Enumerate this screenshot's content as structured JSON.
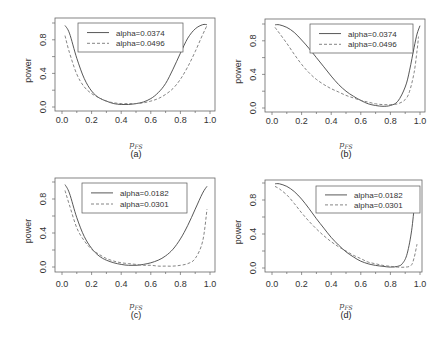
{
  "chart_data": [
    {
      "panel": "(a)",
      "type": "line",
      "xlabel": "p_FS",
      "ylabel": "power",
      "caption": "(a)",
      "xlim": [
        0,
        1
      ],
      "ylim": [
        0,
        1
      ],
      "xticks": [
        "0.0",
        "0.2",
        "0.4",
        "0.6",
        "0.8",
        "1.0"
      ],
      "yticks": [
        "0.0",
        "0.4",
        "0.8"
      ],
      "legend_position": "top-center",
      "series": [
        {
          "name": "alpha=0.0374",
          "style": "solid",
          "x": [
            0.02,
            0.05,
            0.1,
            0.15,
            0.2,
            0.25,
            0.3,
            0.35,
            0.4,
            0.45,
            0.5,
            0.55,
            0.6,
            0.65,
            0.7,
            0.75,
            0.8,
            0.85,
            0.9,
            0.95,
            0.98
          ],
          "y": [
            0.97,
            0.88,
            0.58,
            0.34,
            0.19,
            0.11,
            0.07,
            0.04,
            0.03,
            0.03,
            0.04,
            0.06,
            0.1,
            0.17,
            0.28,
            0.45,
            0.64,
            0.82,
            0.93,
            0.98,
            0.98
          ]
        },
        {
          "name": "alpha=0.0496",
          "style": "dashed",
          "x": [
            0.02,
            0.05,
            0.1,
            0.15,
            0.2,
            0.25,
            0.3,
            0.35,
            0.4,
            0.45,
            0.5,
            0.55,
            0.6,
            0.65,
            0.7,
            0.75,
            0.8,
            0.85,
            0.9,
            0.95,
            0.98
          ],
          "y": [
            0.85,
            0.65,
            0.39,
            0.24,
            0.16,
            0.11,
            0.07,
            0.05,
            0.04,
            0.04,
            0.04,
            0.05,
            0.07,
            0.1,
            0.15,
            0.22,
            0.33,
            0.48,
            0.66,
            0.86,
            0.97
          ]
        }
      ]
    },
    {
      "panel": "(b)",
      "type": "line",
      "xlabel": "p_FS",
      "ylabel": "power",
      "caption": "(b)",
      "xlim": [
        0,
        1
      ],
      "ylim": [
        0,
        1
      ],
      "xticks": [
        "0.0",
        "0.2",
        "0.4",
        "0.6",
        "0.8",
        "1.0"
      ],
      "yticks": [
        "0.0",
        "0.4",
        "0.8"
      ],
      "legend_position": "top-right",
      "series": [
        {
          "name": "alpha=0.0374",
          "style": "solid",
          "x": [
            0.02,
            0.05,
            0.1,
            0.15,
            0.2,
            0.25,
            0.3,
            0.35,
            0.4,
            0.45,
            0.5,
            0.55,
            0.6,
            0.65,
            0.7,
            0.75,
            0.8,
            0.85,
            0.9,
            0.93,
            0.96,
            0.98,
            1.0
          ],
          "y": [
            0.99,
            0.99,
            0.96,
            0.9,
            0.81,
            0.71,
            0.6,
            0.49,
            0.38,
            0.28,
            0.2,
            0.14,
            0.09,
            0.05,
            0.03,
            0.02,
            0.03,
            0.08,
            0.25,
            0.45,
            0.72,
            0.88,
            0.98
          ]
        },
        {
          "name": "alpha=0.0496",
          "style": "dashed",
          "x": [
            0.02,
            0.05,
            0.1,
            0.15,
            0.2,
            0.25,
            0.3,
            0.35,
            0.4,
            0.45,
            0.5,
            0.55,
            0.6,
            0.65,
            0.7,
            0.75,
            0.8,
            0.85,
            0.9,
            0.93,
            0.96,
            0.98,
            0.99
          ],
          "y": [
            0.96,
            0.89,
            0.77,
            0.64,
            0.52,
            0.42,
            0.34,
            0.28,
            0.23,
            0.19,
            0.15,
            0.12,
            0.09,
            0.07,
            0.05,
            0.04,
            0.04,
            0.05,
            0.1,
            0.2,
            0.42,
            0.68,
            0.85
          ]
        }
      ]
    },
    {
      "panel": "(c)",
      "type": "line",
      "xlabel": "p_FS",
      "ylabel": "power",
      "caption": "(c)",
      "xlim": [
        0,
        1
      ],
      "ylim": [
        0,
        1
      ],
      "xticks": [
        "0.0",
        "0.2",
        "0.4",
        "0.6",
        "0.8",
        "1.0"
      ],
      "yticks": [
        "0.0",
        "0.4",
        "0.8"
      ],
      "legend_position": "top-center",
      "series": [
        {
          "name": "alpha=0.0182",
          "style": "solid",
          "x": [
            0.02,
            0.05,
            0.1,
            0.15,
            0.2,
            0.25,
            0.3,
            0.35,
            0.4,
            0.45,
            0.5,
            0.55,
            0.6,
            0.65,
            0.7,
            0.75,
            0.8,
            0.85,
            0.9,
            0.95,
            0.98
          ],
          "y": [
            0.97,
            0.87,
            0.58,
            0.36,
            0.22,
            0.13,
            0.08,
            0.05,
            0.03,
            0.02,
            0.02,
            0.03,
            0.05,
            0.08,
            0.13,
            0.21,
            0.33,
            0.49,
            0.68,
            0.87,
            0.95
          ]
        },
        {
          "name": "alpha=0.0301",
          "style": "dashed",
          "x": [
            0.02,
            0.05,
            0.1,
            0.15,
            0.2,
            0.25,
            0.3,
            0.35,
            0.4,
            0.45,
            0.5,
            0.55,
            0.6,
            0.65,
            0.7,
            0.75,
            0.8,
            0.85,
            0.9,
            0.95,
            0.98
          ],
          "y": [
            0.9,
            0.73,
            0.46,
            0.31,
            0.21,
            0.15,
            0.1,
            0.07,
            0.05,
            0.04,
            0.03,
            0.02,
            0.02,
            0.01,
            0.01,
            0.01,
            0.02,
            0.04,
            0.1,
            0.3,
            0.68
          ]
        }
      ]
    },
    {
      "panel": "(d)",
      "type": "line",
      "xlabel": "p_FS",
      "ylabel": "power",
      "caption": "(d)",
      "xlim": [
        0,
        1
      ],
      "ylim": [
        0,
        1
      ],
      "xticks": [
        "0.0",
        "0.2",
        "0.4",
        "0.6",
        "0.8",
        "1.0"
      ],
      "yticks": [
        "0.0",
        "0.4",
        "0.8"
      ],
      "legend_position": "top-right",
      "series": [
        {
          "name": "alpha=0.0182",
          "style": "solid",
          "x": [
            0.02,
            0.05,
            0.1,
            0.15,
            0.2,
            0.25,
            0.3,
            0.35,
            0.4,
            0.45,
            0.5,
            0.55,
            0.6,
            0.65,
            0.7,
            0.75,
            0.8,
            0.85,
            0.88,
            0.91,
            0.94,
            0.96
          ],
          "y": [
            0.99,
            0.99,
            0.96,
            0.9,
            0.81,
            0.7,
            0.58,
            0.47,
            0.36,
            0.27,
            0.19,
            0.13,
            0.08,
            0.05,
            0.03,
            0.02,
            0.01,
            0.02,
            0.05,
            0.15,
            0.4,
            0.7
          ]
        },
        {
          "name": "alpha=0.0301",
          "style": "dashed",
          "x": [
            0.02,
            0.05,
            0.1,
            0.15,
            0.2,
            0.25,
            0.3,
            0.35,
            0.4,
            0.45,
            0.5,
            0.55,
            0.6,
            0.65,
            0.7,
            0.75,
            0.8,
            0.85,
            0.9,
            0.94,
            0.96,
            0.98
          ],
          "y": [
            0.96,
            0.93,
            0.86,
            0.76,
            0.65,
            0.55,
            0.46,
            0.38,
            0.31,
            0.25,
            0.2,
            0.15,
            0.11,
            0.07,
            0.05,
            0.03,
            0.02,
            0.01,
            0.01,
            0.03,
            0.12,
            0.28
          ]
        }
      ]
    }
  ]
}
